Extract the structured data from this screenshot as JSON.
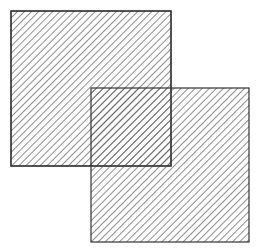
{
  "diagram": {
    "background": "#ffffff",
    "stroke_color": "#333333",
    "hatch_color": "#555555",
    "hatch_spacing": 5,
    "hatch_direction": "diagonal-top-left-to-bottom-right",
    "shapes": [
      {
        "id": "square-1",
        "type": "rect",
        "x": 11,
        "y": 11,
        "width": 160,
        "height": 155,
        "fill": "hatched"
      },
      {
        "id": "square-2",
        "type": "rect",
        "x": 91,
        "y": 88,
        "width": 158,
        "height": 154,
        "fill": "hatched"
      }
    ],
    "overlap": {
      "x": 91,
      "y": 88,
      "width": 80,
      "height": 78
    }
  }
}
